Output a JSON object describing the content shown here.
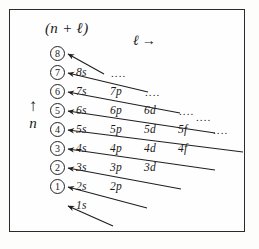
{
  "figure": {
    "header_label": "(n + ℓ)",
    "l_axis_label": "ℓ",
    "l_axis_arrow": "→",
    "n_axis_label": "n",
    "n_axis_arrow": "↑",
    "ellipsis": "....",
    "border_color": "#2a2a2a",
    "ink_color": "#1a1a1a",
    "background_color": "#fdfdfc"
  },
  "circled_numbers": [
    {
      "value": "⑨",
      "text": "8"
    },
    {
      "value": "⑧",
      "text": "7"
    },
    {
      "value": "⑦",
      "text": "6"
    },
    {
      "value": "⑥",
      "text": "5"
    },
    {
      "value": "⑤",
      "text": "4"
    },
    {
      "value": "④",
      "text": "3"
    },
    {
      "value": "③",
      "text": "2"
    },
    {
      "value": "②",
      "text": "1"
    }
  ],
  "rows": [
    {
      "sum_label": "8",
      "orbitals": [],
      "has_ellipsis": false
    },
    {
      "sum_label": "7",
      "orbitals": [
        "8s"
      ],
      "has_ellipsis": true
    },
    {
      "sum_label": "6",
      "orbitals": [
        "7s",
        "7p"
      ],
      "has_ellipsis": true
    },
    {
      "sum_label": "5",
      "orbitals": [
        "6s",
        "6p",
        "6d"
      ],
      "has_ellipsis": true
    },
    {
      "sum_label": "4",
      "orbitals": [
        "5s",
        "5p",
        "5d",
        "5f"
      ],
      "has_ellipsis": true
    },
    {
      "sum_label": "3",
      "orbitals": [
        "4s",
        "4p",
        "4d",
        "4f"
      ],
      "has_ellipsis": false
    },
    {
      "sum_label": "2",
      "orbitals": [
        "3s",
        "3p",
        "3d"
      ],
      "has_ellipsis": false
    },
    {
      "sum_label": "1",
      "orbitals": [
        "2s",
        "2p"
      ],
      "has_ellipsis": false
    },
    {
      "sum_label": "",
      "orbitals": [
        "1s"
      ],
      "has_ellipsis": false
    }
  ],
  "orbital_labels": {
    "r1_c1": "8s",
    "r2_c1": "7s",
    "r2_c2": "7p",
    "r3_c1": "6s",
    "r3_c2": "6p",
    "r3_c3": "6d",
    "r4_c1": "5s",
    "r4_c2": "5p",
    "r4_c3": "5d",
    "r4_c4": "5f",
    "r5_c1": "4s",
    "r5_c2": "4p",
    "r5_c3": "4d",
    "r5_c4": "4f",
    "r6_c1": "3s",
    "r6_c2": "3p",
    "r6_c3": "3d",
    "r7_c1": "2s",
    "r7_c2": "2p",
    "r8_c1": "1s"
  },
  "circle_glyphs": {
    "c8": "8",
    "c7": "7",
    "c6": "6",
    "c5": "5",
    "c4": "4",
    "c3": "3",
    "c2": "2",
    "c1": "1"
  },
  "ellipsis_marks": {
    "e1": "....",
    "e2": "....",
    "e3": "....",
    "e4": "....",
    "e5": "...."
  }
}
